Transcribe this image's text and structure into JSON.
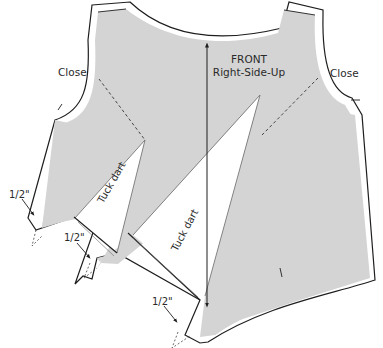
{
  "diagram": {
    "type": "sewing-pattern",
    "colors": {
      "fabric": "#d4d4d4",
      "outline": "#1e1e1e",
      "background": "#ffffff",
      "text": "#2a2a2a"
    },
    "labels": {
      "piece_title": "FRONT",
      "piece_subtitle": "Right-Side-Up",
      "close_left": "Close",
      "close_right": "Close",
      "tuck_dart_1": "Tuck dart",
      "tuck_dart_2": "Tuck dart",
      "seam_allowance_1": "1/2\"",
      "seam_allowance_2": "1/2\"",
      "seam_allowance_3": "1/2\""
    },
    "annotations": [
      {
        "id": "grainline",
        "kind": "arrow",
        "direction": "vertical-double"
      },
      {
        "id": "fold-line-left",
        "kind": "dashed-line"
      },
      {
        "id": "fold-line-right",
        "kind": "dashed-line"
      }
    ]
  }
}
